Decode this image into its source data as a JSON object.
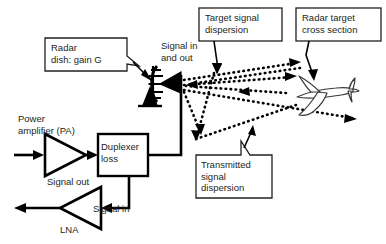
{
  "figure": {
    "type": "block-diagram",
    "background_color": "#ffffff",
    "line_color": "#000000",
    "text_color": "#231f20"
  },
  "callouts": [
    {
      "id": "radar-dish",
      "label": "Radar\ndish: gain G",
      "box": {
        "x": 45,
        "y": 38,
        "w": 82,
        "h": 33
      },
      "leader_to": {
        "x": 152,
        "y": 81
      }
    },
    {
      "id": "target-signal-dispersion",
      "label": "Target signal\ndispersion",
      "box": {
        "x": 199,
        "y": 8,
        "w": 83,
        "h": 33
      },
      "leader_to": {
        "x": 217,
        "y": 73
      }
    },
    {
      "id": "radar-target-cross-section",
      "label": "Radar target\ncross section",
      "box": {
        "x": 296,
        "y": 8,
        "w": 85,
        "h": 33
      },
      "leader_to": {
        "x": 313,
        "y": 81
      }
    },
    {
      "id": "transmitted-signal-dispersion",
      "label": "Transmitted\nsignal\ndispersion",
      "box": {
        "x": 196,
        "y": 155,
        "w": 76,
        "h": 43
      },
      "leader_to": {
        "x": 253,
        "y": 127
      }
    }
  ],
  "plain_labels": [
    {
      "id": "signal-in-and-out",
      "label": "Signal in\nand out",
      "x": 161,
      "y": 40
    },
    {
      "id": "power-amplifier",
      "label": "Power\namplifier (PA)",
      "x": 18,
      "y": 113
    },
    {
      "id": "duplexer-loss",
      "label": "Duplexer\nloss",
      "x": 101,
      "y": 141
    },
    {
      "id": "signal-out",
      "label": "Signal out",
      "x": 47,
      "y": 176
    },
    {
      "id": "signal-in",
      "label": "Signal in",
      "x": 93,
      "y": 203
    },
    {
      "id": "lna",
      "label": "LNA",
      "x": 60,
      "y": 224
    }
  ],
  "blocks": [
    {
      "id": "power-amplifier-symbol",
      "shape": "triangle-amplifier",
      "label": "PA"
    },
    {
      "id": "duplexer-block",
      "shape": "rectangle",
      "label": "Duplexer loss"
    },
    {
      "id": "lna-symbol",
      "shape": "triangle-amplifier",
      "label": "LNA"
    },
    {
      "id": "radar-dish-symbol",
      "shape": "parabolic-dish",
      "label": "Radar dish"
    },
    {
      "id": "feed-horn-symbol",
      "shape": "triangle-horn",
      "label": "Feed horn"
    },
    {
      "id": "dish-pedestal-symbol",
      "shape": "triangle-pedestal",
      "label": "Pedestal"
    },
    {
      "id": "aircraft-target",
      "shape": "airplane-outline",
      "label": "Target aircraft"
    }
  ],
  "signal_paths": [
    {
      "id": "pa-input-arrow",
      "style": "solid",
      "from": "external",
      "to": "power-amplifier"
    },
    {
      "id": "pa-to-duplexer",
      "style": "solid",
      "from": "power-amplifier",
      "to": "duplexer"
    },
    {
      "id": "duplexer-to-antenna",
      "style": "solid",
      "from": "duplexer",
      "to": "feed-horn"
    },
    {
      "id": "duplexer-to-lna",
      "style": "solid",
      "from": "duplexer",
      "to": "lna"
    },
    {
      "id": "lna-output-arrow",
      "style": "solid",
      "from": "lna",
      "to": "external"
    },
    {
      "id": "transmitted-beam-upper",
      "style": "dotted",
      "from": "antenna",
      "to": "target-region"
    },
    {
      "id": "transmitted-beam-mid",
      "style": "dotted",
      "from": "antenna",
      "to": "target-region"
    },
    {
      "id": "transmitted-beam-lower",
      "style": "dotted",
      "from": "antenna",
      "to": "target-region"
    },
    {
      "id": "return-beam-upper",
      "style": "dotted",
      "from": "target-region",
      "to": "antenna"
    },
    {
      "id": "return-beam-mid",
      "style": "dotted",
      "from": "target-region",
      "to": "antenna"
    },
    {
      "id": "return-beam-lower",
      "style": "dotted",
      "from": "target-region",
      "to": "antenna"
    }
  ],
  "caption": {
    "text": "",
    "visible": false
  }
}
